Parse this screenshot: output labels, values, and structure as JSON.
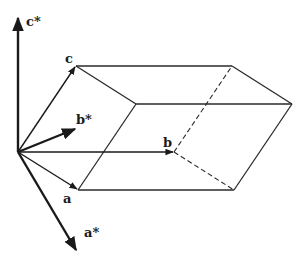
{
  "diagram": {
    "type": "unit-cell-direct-and-reciprocal-lattice-vectors",
    "labels": {
      "c_star": "c*",
      "c": "c",
      "b_star": "b*",
      "b": "b",
      "a": "a",
      "a_star": "a*"
    },
    "colors": {
      "line": "#2a2a2a",
      "background": "#ffffff"
    }
  }
}
